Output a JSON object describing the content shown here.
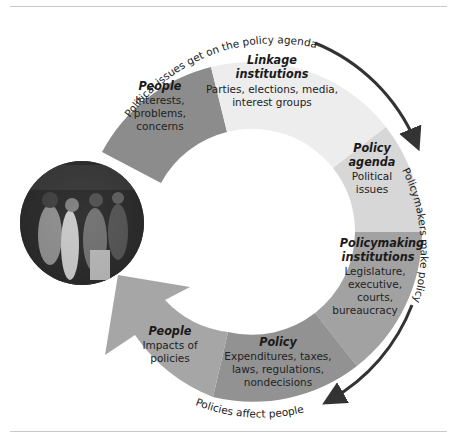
{
  "diagram": {
    "type": "policy-cycle",
    "segments": [
      {
        "id": "people-input",
        "title": "People",
        "lines": [
          "Interests,",
          "problems,",
          "concerns"
        ],
        "color": "#8c8c8c"
      },
      {
        "id": "linkage",
        "title_lines": [
          "Linkage",
          "institutions"
        ],
        "lines": [
          "Parties, elections, media,",
          "interest groups"
        ],
        "color": "#ededed"
      },
      {
        "id": "policy-agenda",
        "title_lines": [
          "Policy",
          "agenda"
        ],
        "lines": [
          "Political",
          "issues"
        ],
        "color": "#d7d7d7"
      },
      {
        "id": "policymaking",
        "title_lines": [
          "Policymaking",
          "institutions"
        ],
        "lines": [
          "Legislature,",
          "executive,",
          "courts,",
          "bureaucracy"
        ],
        "color": "#a2a2a2"
      },
      {
        "id": "policy",
        "title": "Policy",
        "lines": [
          "Expenditures, taxes,",
          "laws, regulations,",
          "nondecisions"
        ],
        "color": "#929292"
      },
      {
        "id": "people-impacts",
        "title": "People",
        "lines": [
          "Impacts of",
          "policies"
        ],
        "color": "#a6a6a6"
      }
    ],
    "flow_labels": {
      "top": "Political issues get on the policy agenda",
      "right": "Policymakers make policy",
      "bottom": "Policies affect people"
    },
    "photo": {
      "alt": "crowd of people"
    }
  }
}
